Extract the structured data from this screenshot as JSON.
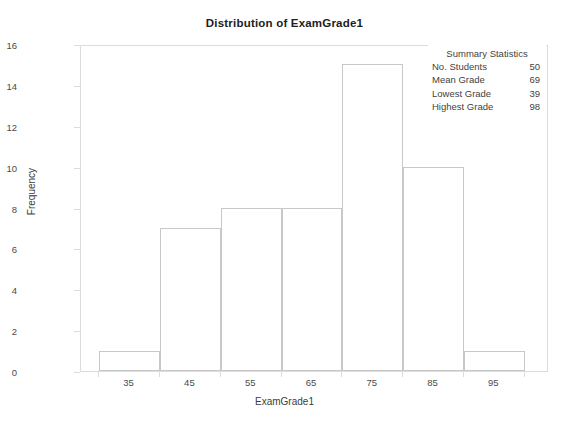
{
  "chart_data": {
    "type": "bar",
    "title": "Distribution of ExamGrade1",
    "xlabel": "ExamGrade1",
    "ylabel": "Frequency",
    "categories": [
      "35",
      "45",
      "55",
      "65",
      "75",
      "85",
      "95"
    ],
    "values": [
      1,
      7,
      8,
      8,
      15,
      10,
      1
    ],
    "bin_edges": [
      30,
      40,
      50,
      60,
      70,
      80,
      90,
      100
    ],
    "xlim": [
      27,
      104
    ],
    "ylim": [
      0,
      16
    ],
    "ytick_labels": [
      "0",
      "2",
      "4",
      "6",
      "8",
      "10",
      "12",
      "14",
      "16"
    ],
    "ytick_values": [
      0,
      2,
      4,
      6,
      8,
      10,
      12,
      14,
      16
    ],
    "xtick_labels": [
      "35",
      "45",
      "55",
      "65",
      "75",
      "85",
      "95"
    ],
    "grid": false,
    "legend": "none",
    "bar_fill_color": "#ffffff",
    "bar_edge_color": "#c8c8c8",
    "frame_color": "#dcdcdc",
    "background_color": "#ffffff",
    "annotations": {
      "summary_title": "Summary Statistics",
      "rows": [
        {
          "label": "No. Students",
          "value": "50"
        },
        {
          "label": "Mean Grade",
          "value": "69"
        },
        {
          "label": "Lowest Grade",
          "value": "39"
        },
        {
          "label": "Highest Grade",
          "value": "98"
        }
      ]
    }
  }
}
